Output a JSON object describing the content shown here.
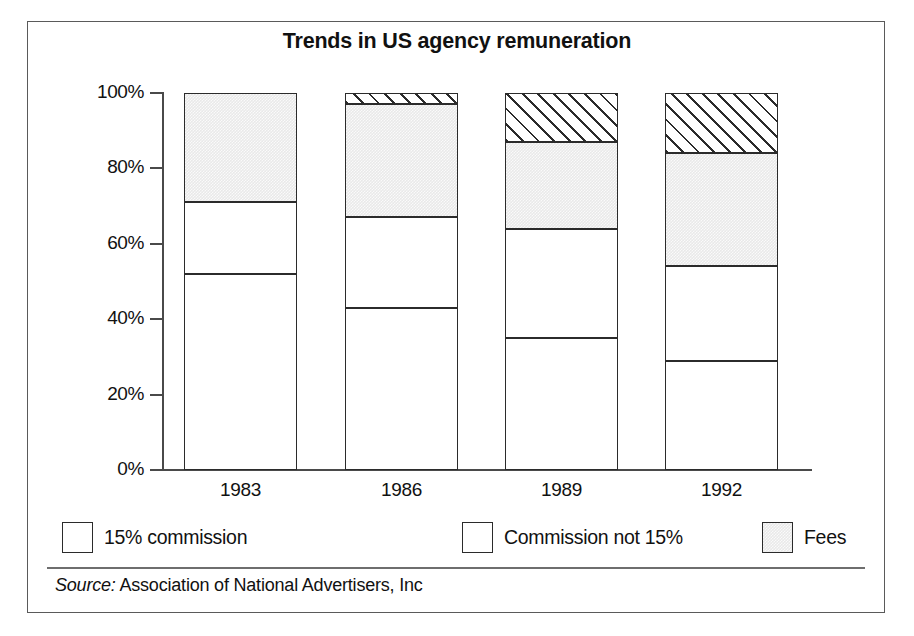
{
  "chart_data": {
    "type": "bar",
    "subtype": "stacked-bar-100-percent",
    "title": "Trends in US agency remuneration",
    "xlabel": "",
    "ylabel": "",
    "categories": [
      "1983",
      "1986",
      "1989",
      "1992"
    ],
    "ylim": [
      0,
      100
    ],
    "ytick_labels": [
      "0%",
      "20%",
      "40%",
      "60%",
      "80%",
      "100%"
    ],
    "ytick_values": [
      0,
      20,
      40,
      60,
      80,
      100
    ],
    "grid": false,
    "legend_position": "bottom",
    "series": [
      {
        "name": "15% commission",
        "values": [
          52,
          43,
          35,
          29
        ]
      },
      {
        "name": "Commission not 15%",
        "values": [
          19,
          24,
          29,
          25
        ]
      },
      {
        "name": "Fees",
        "values": [
          29,
          30,
          23,
          30
        ]
      },
      {
        "name": "Other",
        "values": [
          0,
          3,
          13,
          16
        ]
      }
    ],
    "source": "Source: Association of National Advertisers, Inc",
    "source_label": "Source:",
    "source_text": "Association of National Advertisers, Inc",
    "colors": {
      "commission15": "#9a9a9a",
      "commissionnot15": "#ffffff",
      "fees": "#e9e9e9",
      "other": "#ffffff",
      "outline": "#2b2b2b",
      "axis": "#4a4a4a",
      "frame": "#5a5a5a",
      "text": "#111111",
      "background": "#ffffff"
    }
  },
  "legend": {
    "items": [
      {
        "label": "15% commission",
        "swatch": "commission15-swatch"
      },
      {
        "label": "Commission not 15%",
        "swatch": "commissionnot15-swatch"
      },
      {
        "label": "Fees",
        "swatch": "fees-swatch"
      },
      {
        "label": "Other",
        "swatch": "other-swatch"
      }
    ]
  }
}
